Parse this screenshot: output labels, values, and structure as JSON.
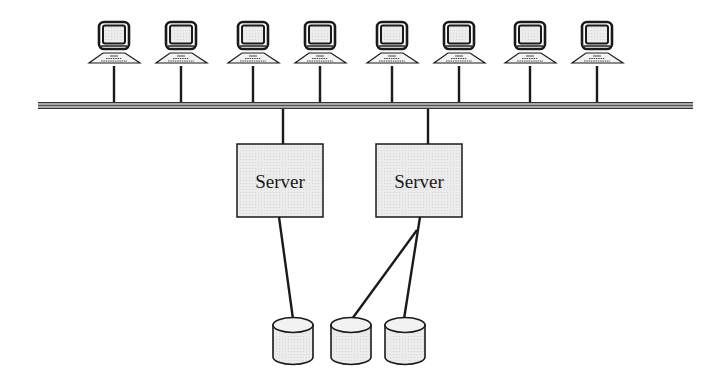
{
  "diagram": {
    "type": "network-topology",
    "colors": {
      "stroke": "#1a1a1a",
      "server_fill": "#e6e6e6",
      "screen_fill": "#e4e4e4",
      "disk_fill": "#efefef",
      "bus_fill": "#9a9a9a"
    },
    "bus": {
      "x1": 38,
      "x2": 693,
      "y": 105
    },
    "computers": [
      {
        "id": "computer-1",
        "cx": 114
      },
      {
        "id": "computer-2",
        "cx": 181
      },
      {
        "id": "computer-3",
        "cx": 253
      },
      {
        "id": "computer-4",
        "cx": 320
      },
      {
        "id": "computer-5",
        "cx": 392
      },
      {
        "id": "computer-6",
        "cx": 459
      },
      {
        "id": "computer-7",
        "cx": 530
      },
      {
        "id": "computer-8",
        "cx": 597
      }
    ],
    "servers": [
      {
        "id": "server-1",
        "label": "Server",
        "x": 237,
        "y": 144,
        "w": 86,
        "h": 73,
        "bus_x": 283
      },
      {
        "id": "server-2",
        "label": "Server",
        "x": 376,
        "y": 144,
        "w": 86,
        "h": 73,
        "bus_x": 428
      }
    ],
    "disks": [
      {
        "id": "disk-1",
        "cx": 293
      },
      {
        "id": "disk-2",
        "cx": 351
      },
      {
        "id": "disk-3",
        "cx": 405
      }
    ],
    "links": [
      {
        "from": "server-1",
        "to": "disk-1",
        "x1": 279,
        "y1": 217,
        "x2": 293,
        "y2": 319
      },
      {
        "from": "server-2",
        "to": "disk-2",
        "x1": 417,
        "y1": 230,
        "x2": 352,
        "y2": 319
      },
      {
        "from": "server-2",
        "to": "disk-3",
        "x1": 420,
        "y1": 217,
        "x2": 404,
        "y2": 319
      }
    ]
  }
}
